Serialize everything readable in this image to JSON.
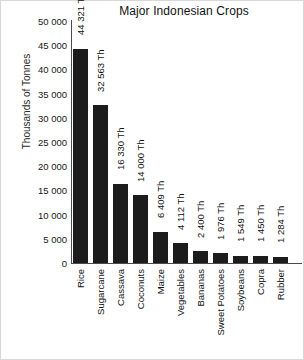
{
  "chart_data": {
    "type": "bar",
    "title": "Major Indonesian Crops",
    "xlabel": "",
    "ylabel": "Thousands of Tonnes",
    "ylim": [
      0,
      50000
    ],
    "grid": false,
    "legend": "none",
    "value_suffix": "Th",
    "categories": [
      "Rice",
      "Sugarcane",
      "Cassava",
      "Coconuts",
      "Maize",
      "Vegetables",
      "Bananas",
      "Sweet Potatoes",
      "Soybeans",
      "Copra",
      "Rubber"
    ],
    "values": [
      44321,
      32563,
      16330,
      14000,
      6409,
      4112,
      2400,
      1976,
      1549,
      1450,
      1284
    ],
    "value_labels": [
      "44 321 Th",
      "32 563 Th",
      "16 330 Th",
      "14 000 Th",
      "6 409 Th",
      "4 112 Th",
      "2 400 Th",
      "1 976 Th",
      "1 549 Th",
      "1 450 Th",
      "1 284 Th"
    ],
    "ytick_values": [
      50000,
      45000,
      40000,
      35000,
      30000,
      25000,
      20000,
      15000,
      10000,
      5000,
      0
    ],
    "ytick_labels": [
      "50 000",
      "45 000",
      "40 000",
      "35 000",
      "30 000",
      "25 000",
      "20 000",
      "15 000",
      "10 000",
      "5 000",
      "0"
    ],
    "bar_color": "#1c1c1c",
    "axis_color": "#4a4a4a",
    "background_color": "#ffffff",
    "text_color": "#111111"
  }
}
